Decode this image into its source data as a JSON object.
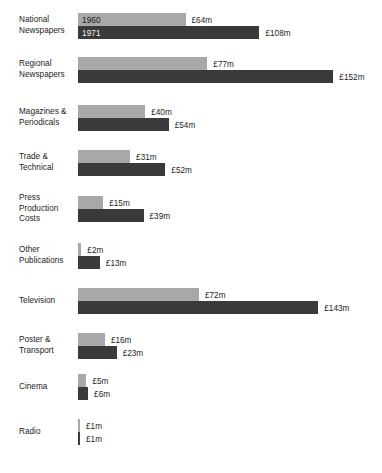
{
  "chart_data": {
    "type": "bar",
    "orientation": "horizontal",
    "title": "",
    "subtitle": "",
    "xlabel": "",
    "ylabel": "",
    "grid": false,
    "legend_position": "inline-first-bar",
    "value_prefix": "£",
    "value_suffix": "m",
    "xlim": [
      0,
      152
    ],
    "categories": [
      "National\nNewspapers",
      "Regional\nNewspapers",
      "Magazines &\nPeriodicals",
      "Trade &\nTechnical",
      "Press\nProduction\nCosts",
      "Other\nPublications",
      "Television",
      "Poster &\nTransport",
      "Cinema",
      "Radio"
    ],
    "series": [
      {
        "name": "1960",
        "color": "#a8a8a8",
        "values": [
          64,
          77,
          40,
          31,
          15,
          2,
          72,
          16,
          5,
          1
        ],
        "labels": [
          "£64m",
          "£77m",
          "£40m",
          "£31m",
          "£15m",
          "£2m",
          "£72m",
          "£16m",
          "£5m",
          "£1m"
        ]
      },
      {
        "name": "1971",
        "color": "#3a3a3a",
        "values": [
          108,
          152,
          54,
          52,
          39,
          13,
          143,
          23,
          6,
          1
        ],
        "labels": [
          "£108m",
          "£152m",
          "£54m",
          "£52m",
          "£39m",
          "£13m",
          "£143m",
          "£23m",
          "£6m",
          "£1m"
        ]
      }
    ]
  },
  "rows": [
    {
      "label": "National\nNewspapers",
      "top": 13,
      "v1960": 64,
      "l1960": "£64m",
      "v1971": 108,
      "l1971": "£108m",
      "legend": "1960",
      "legend2": "1971"
    },
    {
      "label": "Regional\nNewspapers",
      "top": 57,
      "v1960": 77,
      "l1960": "£77m",
      "v1971": 152,
      "l1971": "£152m"
    },
    {
      "label": "Magazines &\nPeriodicals",
      "top": 105,
      "v1960": 40,
      "l1960": "£40m",
      "v1971": 54,
      "l1971": "£54m"
    },
    {
      "label": "Trade &\nTechnical",
      "top": 150,
      "v1960": 31,
      "l1960": "£31m",
      "v1971": 52,
      "l1971": "£52m"
    },
    {
      "label": "Press\nProduction\nCosts",
      "top": 196,
      "v1960": 15,
      "l1960": "£15m",
      "v1971": 39,
      "l1971": "£39m"
    },
    {
      "label": "Other\nPublications",
      "top": 243,
      "v1960": 2,
      "l1960": "£2m",
      "v1971": 13,
      "l1971": "£13m"
    },
    {
      "label": "Television",
      "top": 288,
      "v1960": 72,
      "l1960": "£72m",
      "v1971": 143,
      "l1971": "£143m"
    },
    {
      "label": "Poster &\nTransport",
      "top": 333,
      "v1960": 16,
      "l1960": "£16m",
      "v1971": 23,
      "l1971": "£23m"
    },
    {
      "label": "Cinema",
      "top": 374,
      "v1960": 5,
      "l1960": "£5m",
      "v1971": 6,
      "l1971": "£6m"
    },
    {
      "label": "Radio",
      "top": 419,
      "v1960": 1,
      "l1960": "£1m",
      "v1971": 1,
      "l1971": "£1m"
    }
  ],
  "scale": {
    "px_per_unit": 1.68,
    "bar_origin_x": 78,
    "bar_height": 13,
    "value_gap": 6,
    "min_bar_px": 2
  }
}
